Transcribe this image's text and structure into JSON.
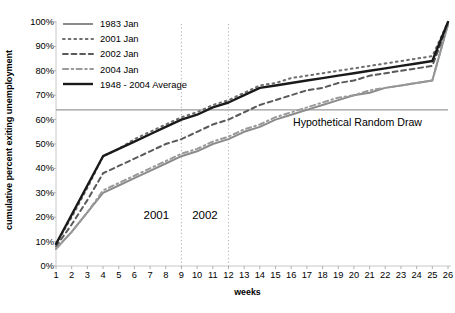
{
  "chart_data": {
    "type": "line",
    "title": "",
    "subtitle": "",
    "xlabel": "weeks",
    "ylabel": "cumulative percent exiting unemployment",
    "xlim": [
      1,
      26
    ],
    "ylim": [
      0,
      100
    ],
    "grid": false,
    "legend_position": "top-left",
    "x": [
      1,
      2,
      3,
      4,
      5,
      6,
      7,
      8,
      9,
      10,
      11,
      12,
      13,
      14,
      15,
      16,
      17,
      18,
      19,
      20,
      21,
      22,
      23,
      24,
      25,
      26
    ],
    "xtick_labels": [
      "1",
      "2",
      "3",
      "4",
      "5",
      "6",
      "7",
      "8",
      "9",
      "10",
      "11",
      "12",
      "13",
      "14",
      "15",
      "16",
      "17",
      "18",
      "19",
      "20",
      "21",
      "22",
      "23",
      "24",
      "25",
      "26"
    ],
    "ytick_labels": [
      "0%",
      "10%",
      "20%",
      "30%",
      "40%",
      "50%",
      "60%",
      "70%",
      "80%",
      "90%",
      "100%"
    ],
    "ytick_values": [
      0,
      10,
      20,
      30,
      40,
      50,
      60,
      70,
      80,
      90,
      100
    ],
    "series": [
      {
        "name": "1983 Jan",
        "style": "solid",
        "color": "#8b8b8b",
        "width": 2.0,
        "values": [
          7,
          14,
          22,
          30,
          33,
          36,
          39,
          42,
          45,
          47,
          50,
          52,
          55,
          57,
          60,
          62,
          64,
          66,
          68,
          70,
          71,
          73,
          74,
          75,
          76,
          99
        ]
      },
      {
        "name": "2001 Jan",
        "style": "dotted",
        "color": "#6e6e6e",
        "width": 2.0,
        "values": [
          9,
          20,
          32,
          45,
          48,
          52,
          55,
          58,
          61,
          63,
          66,
          68,
          71,
          74,
          75,
          77,
          78,
          79,
          80,
          81,
          82,
          83,
          84,
          85,
          86,
          100
        ]
      },
      {
        "name": "2002 Jan",
        "style": "dashed",
        "color": "#5a5a5a",
        "width": 2.0,
        "values": [
          8,
          17,
          27,
          38,
          41,
          44,
          47,
          50,
          52,
          55,
          58,
          60,
          63,
          66,
          68,
          70,
          72,
          73,
          75,
          76,
          78,
          79,
          80,
          81,
          82,
          99
        ]
      },
      {
        "name": "2004 Jan",
        "style": "dashdot",
        "color": "#9a9a9a",
        "width": 2.0,
        "values": [
          7,
          14,
          22,
          31,
          34,
          37,
          40,
          43,
          46,
          48,
          51,
          53,
          56,
          58,
          61,
          63,
          65,
          67,
          69,
          70,
          72,
          73,
          74,
          75,
          76,
          99
        ]
      },
      {
        "name": "1948 - 2004 Average",
        "style": "solid",
        "color": "#1a1a1a",
        "width": 2.4,
        "values": [
          9,
          21,
          33,
          45,
          48,
          51,
          54,
          57,
          60,
          62,
          65,
          67,
          70,
          73,
          74,
          75,
          76,
          77,
          78,
          79,
          80,
          81,
          82,
          83,
          84,
          100
        ]
      }
    ],
    "reference_lines": [
      {
        "name": "hypothetical-random-draw",
        "orientation": "horizontal",
        "value": 64,
        "label": "Hypothetical Random Draw",
        "style": "solid",
        "color": "#9a9a9a"
      },
      {
        "name": "year-divider-2001-2002",
        "orientation": "vertical",
        "value": 9,
        "label": "",
        "style": "dotted",
        "color": "#b4b4b4"
      },
      {
        "name": "year-divider-2002-end",
        "orientation": "vertical",
        "value": 12,
        "label": "",
        "style": "dotted",
        "color": "#b4b4b4"
      }
    ],
    "annotations": [
      {
        "name": "band-label-2001",
        "text": "2001",
        "x": 7.4,
        "y": 20
      },
      {
        "name": "band-label-2002",
        "text": "2002",
        "x": 10.5,
        "y": 20
      }
    ]
  }
}
